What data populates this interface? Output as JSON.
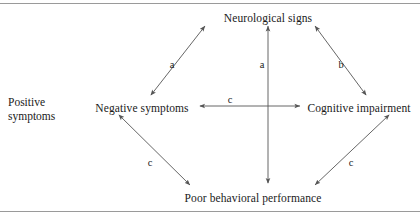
{
  "figure": {
    "width": 420,
    "height": 218,
    "background": "#ffffff",
    "line_color": "#555555",
    "text_color": "#1a1a1a",
    "rule_color": "#9a9a9a"
  },
  "side_note": {
    "line1": "Positive",
    "line2": "symptoms"
  },
  "nodes": [
    {
      "id": "neurological-signs",
      "label": "Neurological signs",
      "x": 268,
      "y": 12
    },
    {
      "id": "negative-symptoms",
      "label": "Negative symptoms",
      "x": 142,
      "y": 102
    },
    {
      "id": "cognitive-impairment",
      "label": "Cognitive impairment",
      "x": 359,
      "y": 102
    },
    {
      "id": "poor-behavioral-performance",
      "label": "Poor behavioral performance",
      "x": 253,
      "y": 192
    }
  ],
  "edges": [
    {
      "id": "negative-symptoms-to-neurological-signs",
      "from": "negative-symptoms",
      "to": "neurological-signs",
      "label": "a",
      "label_x": 172,
      "label_y": 64,
      "arrowheads": "both"
    },
    {
      "id": "poor-behavioral-performance-to-neurological-signs",
      "from": "poor-behavioral-performance",
      "to": "neurological-signs",
      "label": "a",
      "label_x": 262,
      "label_y": 64,
      "arrowheads": "both"
    },
    {
      "id": "cognitive-impairment-to-neurological-signs",
      "from": "cognitive-impairment",
      "to": "neurological-signs",
      "label": "b",
      "label_x": 341,
      "label_y": 64,
      "arrowheads": "both"
    },
    {
      "id": "negative-symptoms-to-cognitive-impairment",
      "from": "negative-symptoms",
      "to": "cognitive-impairment",
      "label": "c",
      "label_x": 230,
      "label_y": 99,
      "arrowheads": "both"
    },
    {
      "id": "negative-symptoms-to-poor-behavioral-performance",
      "from": "negative-symptoms",
      "to": "poor-behavioral-performance",
      "label": "c",
      "label_x": 150,
      "label_y": 162,
      "arrowheads": "both"
    },
    {
      "id": "cognitive-impairment-to-poor-behavioral-performance",
      "from": "cognitive-impairment",
      "to": "poor-behavioral-performance",
      "label": "c",
      "label_x": 351,
      "label_y": 162,
      "arrowheads": "both"
    }
  ]
}
